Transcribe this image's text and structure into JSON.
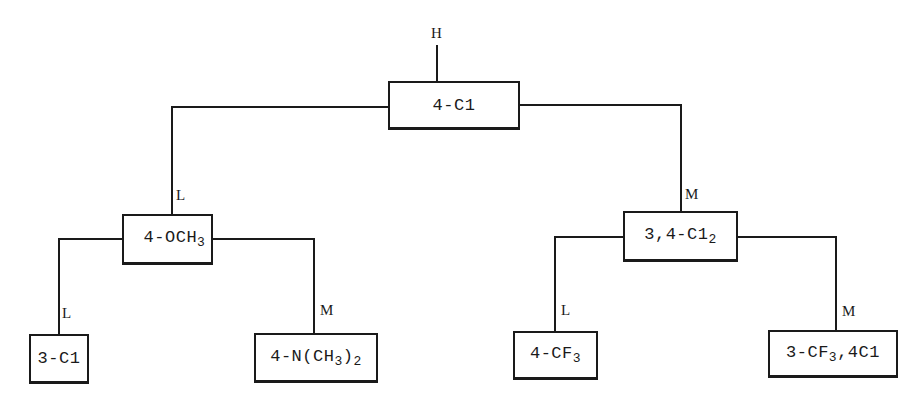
{
  "diagram": {
    "type": "decision-tree",
    "root_input_label": "H",
    "nodes": [
      {
        "id": "root",
        "text": "4-Cl",
        "display": "4-C1"
      },
      {
        "id": "L",
        "text": "4-OCH3",
        "display_main": "4-OCH",
        "display_sub": "3"
      },
      {
        "id": "M",
        "text": "3,4-Cl2",
        "display_main": "3,4-C1",
        "display_sub": "2"
      },
      {
        "id": "LL",
        "text": "3-Cl",
        "display": "3-C1"
      },
      {
        "id": "LM",
        "text": "4-N(CH3)2",
        "display_a": "4-N(CH",
        "display_sub1": "3",
        "display_b": ")",
        "display_sub2": "2"
      },
      {
        "id": "ML",
        "text": "4-CF3",
        "display_main": "4-CF",
        "display_sub": "3"
      },
      {
        "id": "MM",
        "text": "3-CF3,4Cl",
        "display_a": "3-CF",
        "display_sub": "3",
        "display_b": ",4C1"
      }
    ],
    "edges": [
      {
        "from": "root",
        "to": "L",
        "label": "L"
      },
      {
        "from": "root",
        "to": "M",
        "label": "M"
      },
      {
        "from": "L",
        "to": "LL",
        "label": "L"
      },
      {
        "from": "L",
        "to": "LM",
        "label": "M"
      },
      {
        "from": "M",
        "to": "ML",
        "label": "L"
      },
      {
        "from": "M",
        "to": "MM",
        "label": "M"
      }
    ]
  },
  "labels": {
    "top": "H",
    "root_left": "L",
    "root_right": "M",
    "l_left": "L",
    "l_right": "M",
    "m_left": "L",
    "m_right": "M"
  },
  "colors": {
    "ink": "#1a1a1a",
    "background": "#ffffff"
  }
}
